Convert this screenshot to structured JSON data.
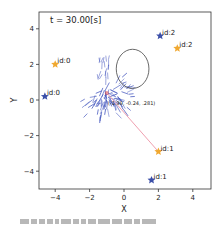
{
  "chart_data": {
    "type": "scatter",
    "title": "",
    "annotation_time": "t = 30.00[s]",
    "xlabel": "X",
    "ylabel": "Y",
    "xlim": [
      -5,
      5
    ],
    "ylim": [
      -5,
      5
    ],
    "xticks": [
      -4,
      -2,
      0,
      2,
      4
    ],
    "yticks": [
      -4,
      -2,
      0,
      2,
      4
    ],
    "grid": false,
    "legend": null,
    "series": [
      {
        "name": "blue stars",
        "marker": "star",
        "color": "#3b4fa8",
        "points": [
          {
            "x": -4.6,
            "y": 0.2,
            "label": "id:0"
          },
          {
            "x": 1.6,
            "y": -4.5,
            "label": "id:1"
          },
          {
            "x": 2.1,
            "y": 3.6,
            "label": "id:2"
          }
        ]
      },
      {
        "name": "orange stars",
        "marker": "star",
        "color": "#f0a830",
        "points": [
          {
            "x": -4.0,
            "y": 2.0,
            "label": "id:0"
          },
          {
            "x": 2.0,
            "y": -2.9,
            "label": "id:1"
          },
          {
            "x": 3.1,
            "y": 2.9,
            "label": "id:2"
          }
        ]
      }
    ],
    "swarm": {
      "center": {
        "x": -1.0,
        "y": 0.4
      },
      "color": "#4a5cc0",
      "center_label": "(-1.39, -0.24, .281)"
    },
    "ellipse": {
      "cx": 0.5,
      "cy": 1.75,
      "rx": 0.95,
      "ry": 1.1,
      "color": "#444444"
    },
    "link_line": {
      "from": {
        "x": -1.0,
        "y": 0.4
      },
      "to": {
        "x": 2.0,
        "y": -2.9
      },
      "color": "#f0a0b0"
    }
  },
  "caption": {
    "text_blocks": 14
  }
}
